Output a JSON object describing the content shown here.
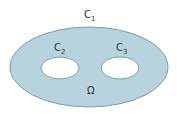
{
  "diagram": {
    "labels": {
      "c1": "C",
      "c1_sub": "1",
      "c2": "C",
      "c2_sub": "2",
      "c3": "C",
      "c3_sub": "3",
      "omega": "Ω"
    },
    "colors": {
      "fill": "#b7d3dd",
      "stroke": "#7f9ca6",
      "hole": "#ffffff"
    }
  }
}
